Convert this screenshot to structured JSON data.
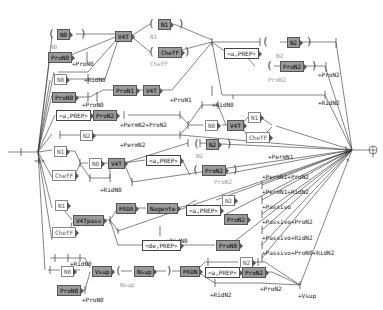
{
  "diagram": {
    "type": "grammar-graph",
    "nodes": {
      "n_top": "N0",
      "pron0": "ProN0",
      "n0b": "N0",
      "pronN_l": "ProN0",
      "v4t_top": "V4T",
      "n1_top": "N1",
      "chef_top": "ChefF",
      "pron1_mid": "ProN1",
      "v4t_mid": "V4T",
      "a_prep_top": "<a,PREP>",
      "n2_top": "N2",
      "pron2_top": "ProN2",
      "a_prep_l": "<a,PREP>",
      "pron2_l": "ProN2",
      "n2_l": "N2",
      "n1_l": "N1",
      "chef_l": "ChefF",
      "n0_c": "N0",
      "v4t_c": "V4T",
      "n0_r": "N0",
      "v4t_r": "V4T",
      "n1_r": "N1",
      "chef_r": "ChefF",
      "n2_c": "N2",
      "a_prep_c": "<a,PREP>",
      "pron2_c": "ProN2",
      "n1_b": "N1",
      "chef_b": "ChefF",
      "v4tpass": "V4Tpass",
      "pada": "PADA",
      "nagente": "Nagente",
      "a_prep_b": "<a,PREP>",
      "n2_b": "N2",
      "pron2_b": "ProN2",
      "de_prep": "<de,PREP>",
      "pron0_b": "ProN0",
      "n0_low": "N0",
      "pron0_low": "ProN0",
      "vsup": "Vsup",
      "nsup": "Nsup",
      "padn": "PADN",
      "a_prep_low": "<a,PREP>",
      "pron2_low": "ProN2",
      "n2_low": "N2"
    },
    "var_labels": {
      "n0": "N0",
      "n1": "N1",
      "chef": "ChefF",
      "n2": "N2",
      "pron2": "ProN2",
      "nsup": "Nsup"
    },
    "outputs": {
      "proN0_a": "+ProN0",
      "ridN0_a": "+RidN0",
      "proN0_b": "+ProN0",
      "proN1": "+ProN1",
      "proN2_top": "+ProN2",
      "ridN2_top": "+RidN2",
      "ridN0_r": "+RidN0",
      "permN2_proN2": "+PermN2+ProN2",
      "permN2": "+PermN2",
      "permN1": "+PermN1",
      "ridN0_c": "+RidN0",
      "permN1_proN2": "+PermN1+ProN2",
      "permN1_ridN2": "+PermN1+RidN2",
      "passivo": "+Passivo",
      "passivo_proN2": "+Passivo+ProN2",
      "passivo_ridN2": "+Passivo+RidN2",
      "passivo_proN0_ridN2": "+Passivo+ProN0+RidN2",
      "ridN0_b": "+RidN0",
      "ridN0_low": "+RidN0",
      "proN0_low": "+ProN0",
      "ridN2_low": "+RidN2",
      "proN2_low": "+ProN2",
      "vsup": "+Vsup"
    },
    "colors": {
      "box_dark": "#9a9a9a",
      "box_border": "#555555",
      "line": "#333333",
      "grey_text": "#999999"
    }
  }
}
